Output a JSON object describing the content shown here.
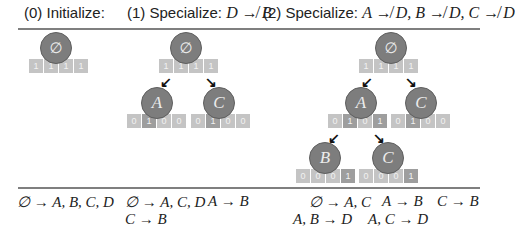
{
  "headers": {
    "step0": "(0) Initialize:",
    "step1_prefix": "(1) Specialize: ",
    "step1_rule": "D ↛ B",
    "step2_prefix": "(2) Specialize: ",
    "step2_rule": "A ↛ D, B ↛ D, C ↛ D"
  },
  "trees": {
    "step0": {
      "root": {
        "label": "∅",
        "bits": [
          "1",
          "1",
          "1",
          "1"
        ]
      }
    },
    "step1": {
      "root": {
        "label": "∅",
        "bits": [
          "1",
          "1",
          "1",
          "1"
        ]
      },
      "left": {
        "label": "A",
        "bits": [
          "0",
          "1",
          "0",
          "0"
        ]
      },
      "right": {
        "label": "C",
        "bits": [
          "0",
          "1",
          "0",
          "0"
        ]
      }
    },
    "step2": {
      "root": {
        "label": "∅",
        "bits": [
          "1",
          "1",
          "1",
          "1"
        ]
      },
      "left": {
        "label": "A",
        "bits": [
          "0",
          "1",
          "0",
          "1"
        ]
      },
      "right": {
        "label": "C",
        "bits": [
          "0",
          "1",
          "0",
          "0"
        ]
      },
      "leftleft": {
        "label": "B",
        "bits": [
          "0",
          "0",
          "0",
          "1"
        ]
      },
      "leftright": {
        "label": "C",
        "bits": [
          "0",
          "0",
          "0",
          "1"
        ]
      }
    }
  },
  "rules": {
    "step0": [
      "∅ → A, B, C, D"
    ],
    "step1": [
      "∅ → A, C, D",
      "A → B",
      "C → B"
    ],
    "step2": [
      "∅ → A, C",
      "A → B",
      "C → B",
      "A, B → D",
      "A, C → D"
    ]
  },
  "colors": {
    "node": "#7d7d7d",
    "bit": "#c4c4c4",
    "bit_on": "#9e9e9e",
    "rule_line": "#7f7f7f"
  }
}
